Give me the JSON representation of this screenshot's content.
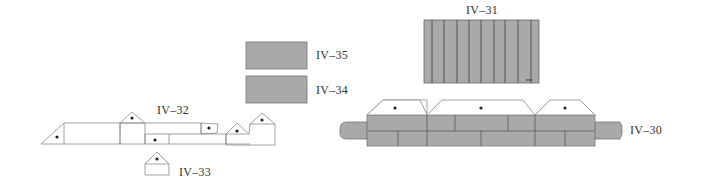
{
  "colors": {
    "fill_gray": "#a9a9a9",
    "line_dark": "#555555",
    "line_light": "#9a9a9a",
    "background": "#ffffff",
    "dot": "#222222"
  },
  "labels": {
    "iv31": "IV–31",
    "iv35": "IV–35",
    "iv34": "IV–34",
    "iv32": "IV–32",
    "iv33": "IV–33",
    "iv30": "IV–30"
  },
  "pieces": [
    {
      "id": "IV-31",
      "type": "striped-panel",
      "stripes": 9
    },
    {
      "id": "IV-35",
      "type": "gray-rectangle"
    },
    {
      "id": "IV-34",
      "type": "gray-rectangle"
    },
    {
      "id": "IV-32",
      "type": "outline-strip-with-tabs",
      "dots": 6
    },
    {
      "id": "IV-33",
      "type": "outline-house-tab",
      "dots": 1
    },
    {
      "id": "IV-30",
      "type": "gray-band-with-trapezoid-tabs",
      "dots": 3
    }
  ]
}
